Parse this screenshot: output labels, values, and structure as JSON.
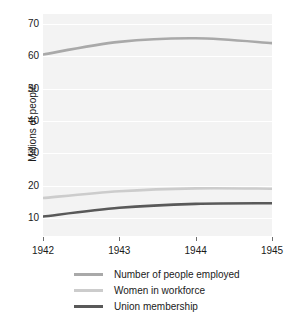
{
  "chart_data": {
    "type": "line",
    "title": "",
    "xlabel": "",
    "ylabel": "Millions of people",
    "x": [
      1942,
      1943,
      1944,
      1945
    ],
    "xticklabels": [
      "1942",
      "1943",
      "1944",
      "1945"
    ],
    "yticklabels": [
      "10",
      "20",
      "30",
      "40",
      "50",
      "60",
      "70"
    ],
    "yticks": [
      10,
      20,
      30,
      40,
      50,
      60,
      70
    ],
    "ylim": [
      4.5,
      73
    ],
    "xlim": [
      1942,
      1945
    ],
    "grid": true,
    "grid_axis": "y",
    "legend_position": "bottom",
    "series": [
      {
        "name": "Number of people employed",
        "color": "#a9a9a9",
        "values": [
          60.5,
          64.4,
          65.5,
          64.0
        ]
      },
      {
        "name": "Women in workforce",
        "color": "#cccccc",
        "values": [
          16.2,
          18.3,
          19.2,
          19.1
        ]
      },
      {
        "name": "Union membership",
        "color": "#595959",
        "values": [
          10.5,
          13.2,
          14.4,
          14.6
        ]
      }
    ]
  },
  "figure": {
    "background_color": "#ffffff",
    "plot_background_color": "#f3f3f3",
    "gridline_color": "#ffffff",
    "tick_color": "#6e6e6e",
    "text_color": "#1a1a1a"
  }
}
